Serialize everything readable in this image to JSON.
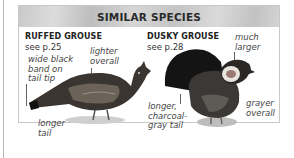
{
  "panel": {
    "title": "SIMILAR SPECIES"
  },
  "species": [
    {
      "name": "RUFFED GROUSE",
      "reference": "see p.25",
      "notes": {
        "tail_band": [
          "wide black",
          "band on",
          "tail tip"
        ],
        "color": [
          "lighter",
          "overall"
        ],
        "tail_length": [
          "longer",
          "tail"
        ]
      }
    },
    {
      "name": "DUSKY GROUSE",
      "reference": "see p.28",
      "notes": {
        "size": [
          "much",
          "larger"
        ],
        "tail": [
          "longer,",
          "charcoal-",
          "gray tail"
        ],
        "color": [
          "grayer",
          "overall"
        ]
      }
    }
  ]
}
